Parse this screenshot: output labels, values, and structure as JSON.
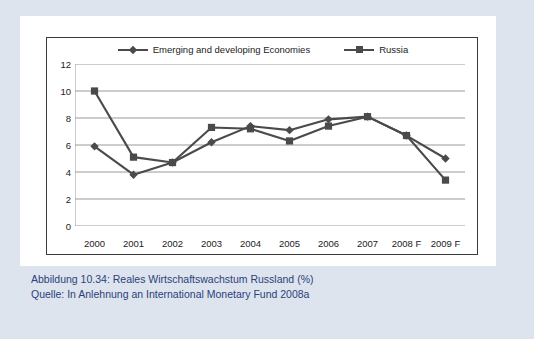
{
  "figure": {
    "caption_line_1": "Abbildung 10.34:  Reales Wirtschaftswachstum Russland (%)",
    "caption_line_2": "Quelle: In Anlehnung an International Monetary Fund 2008a",
    "accent_color": "#2b3f7a",
    "background_color": "#dde4ee",
    "series_color": "#4a4a4a"
  },
  "chart_data": {
    "type": "line",
    "title": "",
    "xlabel": "",
    "ylabel": "",
    "ylim": [
      0,
      12
    ],
    "yticks": [
      "0",
      "2",
      "4",
      "6",
      "8",
      "10",
      "12"
    ],
    "ytick_values": [
      0,
      2,
      4,
      6,
      8,
      10,
      12
    ],
    "grid": "horizontal",
    "legend_position": "top-center",
    "categories": [
      "2000",
      "2001",
      "2002",
      "2003",
      "2004",
      "2005",
      "2006",
      "2007",
      "2008 F",
      "2009 F"
    ],
    "series": [
      {
        "name": "Emerging and developing Economies",
        "marker": "diamond",
        "values": [
          5.9,
          3.8,
          4.7,
          6.2,
          7.4,
          7.1,
          7.9,
          8.1,
          6.7,
          5.0
        ]
      },
      {
        "name": "Russia",
        "marker": "square",
        "values": [
          10.0,
          5.1,
          4.7,
          7.3,
          7.2,
          6.3,
          7.4,
          8.1,
          6.7,
          3.4
        ]
      }
    ]
  }
}
